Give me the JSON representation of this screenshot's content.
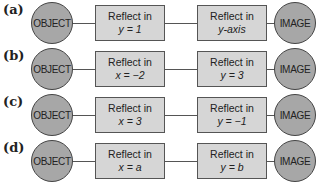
{
  "rows": [
    {
      "label": "(a)",
      "start": "OBJECT",
      "step1": {
        "title": "Reflect in",
        "eq": "y = 1"
      },
      "step2": {
        "title": "Reflect in",
        "eq": "y-axis"
      },
      "end": "IMAGE"
    },
    {
      "label": "(b)",
      "start": "OBJECT",
      "step1": {
        "title": "Reflect in",
        "eq": "x = −2"
      },
      "step2": {
        "title": "Reflect in",
        "eq": "y = 3"
      },
      "end": "IMAGE"
    },
    {
      "label": "(c)",
      "start": "OBJECT",
      "step1": {
        "title": "Reflect in",
        "eq": "x = 3"
      },
      "step2": {
        "title": "Reflect in",
        "eq": "y = −1"
      },
      "end": "IMAGE"
    },
    {
      "label": "(d)",
      "start": "OBJECT",
      "step1": {
        "title": "Reflect in",
        "eq": "x = a"
      },
      "step2": {
        "title": "Reflect in",
        "eq": "y = b"
      },
      "end": "IMAGE"
    }
  ]
}
